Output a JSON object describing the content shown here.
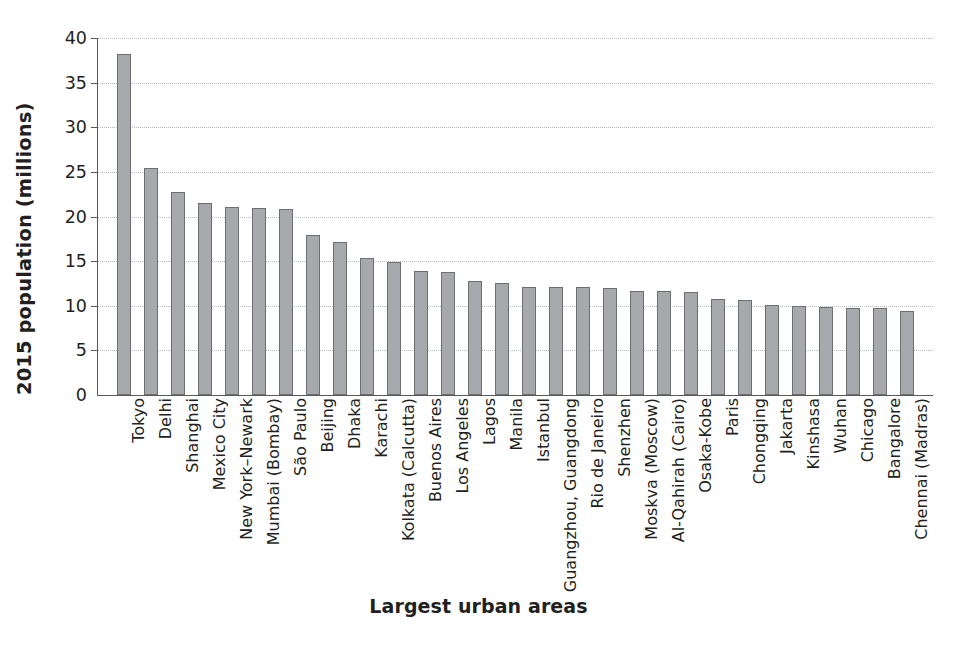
{
  "chart_data": {
    "type": "bar",
    "title": "",
    "xlabel": "Largest urban areas",
    "ylabel": "2015 population (millions)",
    "ylim": [
      0,
      40
    ],
    "yticks": [
      0,
      5,
      10,
      15,
      20,
      25,
      30,
      35,
      40
    ],
    "ytick_labels": [
      "0",
      "5",
      "10",
      "15",
      "20",
      "25",
      "30",
      "35",
      "40"
    ],
    "grid": true,
    "legend": "none",
    "bar_color": "#a7a9ac",
    "bar_edge_color": "#6d6e71",
    "axis_color": "#58595b",
    "gridline_color": "#b9babc",
    "categories": [
      "Tokyo",
      "Delhi",
      "Shanghai",
      "Mexico City",
      "New York–Newark",
      "Mumbai (Bombay)",
      "São Paulo",
      "Beijing",
      "Dhaka",
      "Karachi",
      "Kolkata (Calcutta)",
      "Buenos Aires",
      "Los Angeles",
      "Lagos",
      "Manila",
      "Istanbul",
      "Guangzhou, Guangdong",
      "Rio de Janeiro",
      "Shenzhen",
      "Moskva (Moscow)",
      "Al-Qahirah (Cairo)",
      "Osaka-Kobe",
      "Paris",
      "Chongqing",
      "Jakarta",
      "Kinshasa",
      "Wuhan",
      "Chicago",
      "Bangalore",
      "Chennai (Madras)"
    ],
    "values": [
      38.2,
      25.4,
      22.8,
      21.5,
      21.1,
      21.0,
      20.8,
      17.9,
      17.2,
      15.3,
      14.9,
      13.9,
      13.8,
      12.8,
      12.5,
      12.1,
      12.1,
      12.1,
      12.0,
      11.7,
      11.6,
      11.5,
      10.8,
      10.6,
      10.1,
      10.0,
      9.9,
      9.7,
      9.8,
      9.4
    ]
  }
}
